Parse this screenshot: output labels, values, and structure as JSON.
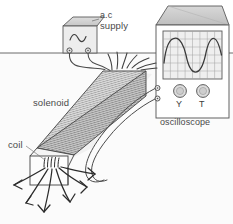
{
  "diagram": {
    "background_color": "#ffffff",
    "stroke_color": "#4a4a4a",
    "bench_line": {
      "label": "bench-surface-line",
      "y": 53
    },
    "labels": {
      "ac": "a.c",
      "supply": "supply",
      "solenoid": "solenoid",
      "coil": "coil",
      "oscilloscope": "oscilloscope"
    },
    "ac_supply": {
      "name": "a.c supply unit",
      "symbol": "sine-wave",
      "terminals": 2,
      "body_fill": "#e9e9e9",
      "top_fill": "#cfcfcf"
    },
    "oscilloscope": {
      "name": "oscilloscope",
      "screen": {
        "grid_columns": 8,
        "grid_rows": 6,
        "trace": "sine",
        "cycles": 2.5,
        "screen_fill": "#f0f0f0",
        "grid_color": "#9a9a9a",
        "trace_color": "#3a3a3a"
      },
      "controls": [
        {
          "label": "Y",
          "name": "y-gain-knob"
        },
        {
          "label": "T",
          "name": "timebase-knob"
        }
      ],
      "terminals": 2,
      "body_fill": "#ffffff",
      "top_fill": "#c9c9c9"
    },
    "solenoid": {
      "name": "solenoid",
      "winding_hatch": true,
      "top_face_fill": "#d2d2d2",
      "front_face_fill": "#c4c4c4",
      "end_face_fill": "#f2f2f2",
      "lead_wires": 6
    },
    "field_lines": {
      "name": "magnetic-field-lines",
      "count": 6,
      "arrowheads": true,
      "direction": "radiating outward from solenoid end"
    },
    "wires": {
      "supply_to_solenoid": 2,
      "coil_to_oscilloscope": 2
    }
  }
}
